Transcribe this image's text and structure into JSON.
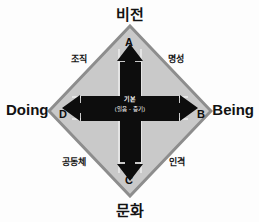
{
  "diagram": {
    "title_top": "비전",
    "title_bottom": "문화",
    "title_left": "Doing",
    "title_right": "Being",
    "vertices": [
      {
        "key": "A",
        "label": "A",
        "position": "top"
      },
      {
        "key": "B",
        "label": "B",
        "position": "right"
      },
      {
        "key": "C",
        "label": "C",
        "position": "bottom"
      },
      {
        "key": "D",
        "label": "D",
        "position": "left"
      }
    ],
    "quadrants": [
      {
        "key": "top-left",
        "label": "조직"
      },
      {
        "key": "top-right",
        "label": "명성"
      },
      {
        "key": "bottom-left",
        "label": "공동체"
      },
      {
        "key": "bottom-right",
        "label": "인격"
      }
    ],
    "center": {
      "line1": "기본",
      "line2": "(일음 - 증기)"
    },
    "colors": {
      "diamond_fill": "#c9c9c9",
      "diamond_stroke": "#8d8d8d",
      "arrow_fill": "#0d0d0d",
      "arrow_outline": "#ffffff",
      "text": "#121212",
      "center_text": "#ffffff",
      "background": "#fdfdfd"
    },
    "shapes": {
      "diamond": "rotated-square",
      "cross": "four-way-double-arrow"
    }
  }
}
